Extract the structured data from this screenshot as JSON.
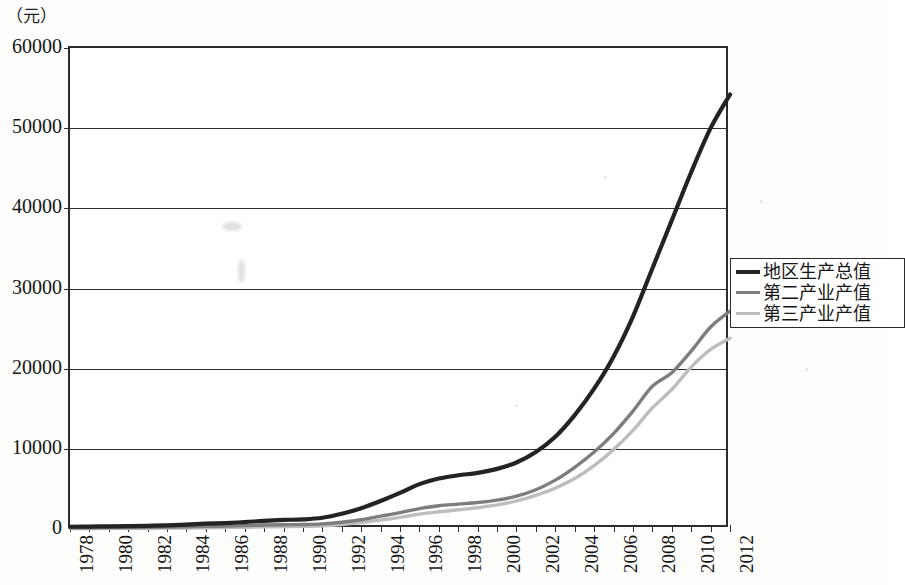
{
  "axis": {
    "unit_label": "（元）",
    "y_ticks": [
      "0",
      "10000",
      "20000",
      "30000",
      "40000",
      "50000",
      "60000"
    ],
    "x_ticks": [
      "1978",
      "1980",
      "1982",
      "1984",
      "1986",
      "1988",
      "1990",
      "1992",
      "1994",
      "1996",
      "1998",
      "2000",
      "2002",
      "2004",
      "2006",
      "2008",
      "2010",
      "2012"
    ]
  },
  "legend": {
    "items": [
      {
        "label": "地区生产总值",
        "color": "#232323"
      },
      {
        "label": "第二产业产值",
        "color": "#7d7d7d"
      },
      {
        "label": "第三产业产值",
        "color": "#bdbdbd"
      }
    ]
  },
  "chart_data": {
    "type": "line",
    "title": "",
    "xlabel": "",
    "ylabel": "（元）",
    "ylim": [
      0,
      60000
    ],
    "xlim": [
      1978,
      2012
    ],
    "grid": true,
    "legend_position": "right",
    "x": [
      1978,
      1979,
      1980,
      1981,
      1982,
      1983,
      1984,
      1985,
      1986,
      1987,
      1988,
      1989,
      1990,
      1991,
      1992,
      1993,
      1994,
      1995,
      1996,
      1997,
      1998,
      1999,
      2000,
      2001,
      2002,
      2003,
      2004,
      2005,
      2006,
      2007,
      2008,
      2009,
      2010,
      2011,
      2012
    ],
    "series": [
      {
        "name": "地区生产总值",
        "color": "#232323",
        "values": [
          280,
          300,
          330,
          360,
          400,
          450,
          540,
          660,
          740,
          860,
          1020,
          1130,
          1200,
          1400,
          1900,
          2600,
          3500,
          4500,
          5600,
          6300,
          6700,
          7000,
          7500,
          8300,
          9600,
          11500,
          14200,
          17500,
          21500,
          26500,
          32500,
          38500,
          44500,
          50000,
          54200
        ]
      },
      {
        "name": "第二产业产值",
        "color": "#7d7d7d",
        "values": [
          150,
          160,
          175,
          190,
          210,
          235,
          275,
          330,
          370,
          420,
          490,
          530,
          560,
          640,
          850,
          1150,
          1600,
          2050,
          2550,
          2900,
          3100,
          3300,
          3600,
          4100,
          4900,
          6100,
          7700,
          9600,
          11900,
          14700,
          17800,
          19500,
          22200,
          25200,
          27200
        ]
      },
      {
        "name": "第三产业产值",
        "color": "#bdbdbd",
        "values": [
          60,
          65,
          72,
          80,
          90,
          105,
          130,
          165,
          190,
          225,
          270,
          300,
          330,
          400,
          560,
          800,
          1100,
          1450,
          1850,
          2150,
          2400,
          2650,
          3000,
          3500,
          4200,
          5100,
          6300,
          7900,
          9900,
          12300,
          15100,
          17400,
          20200,
          22400,
          23800
        ]
      }
    ]
  }
}
